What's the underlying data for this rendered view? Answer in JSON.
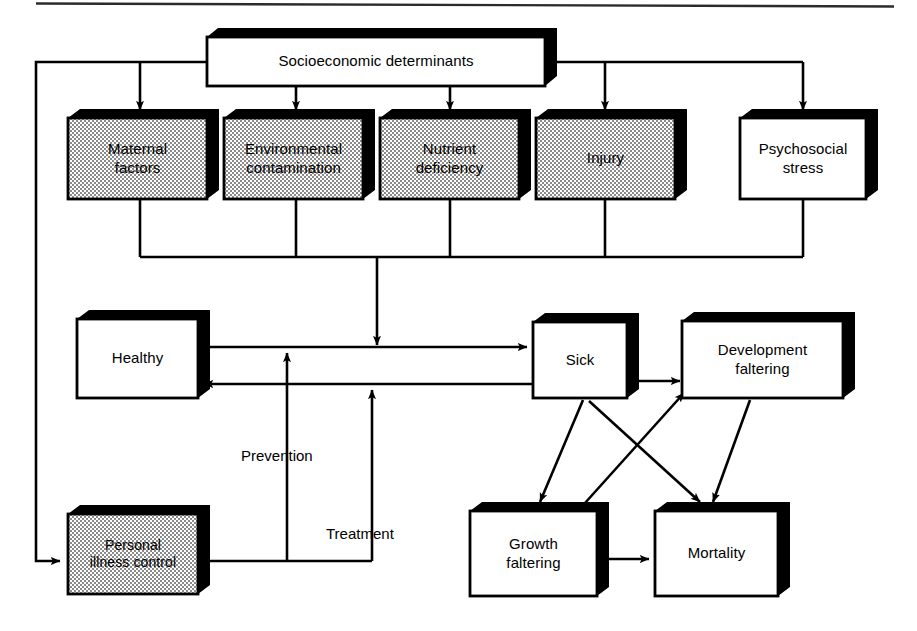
{
  "figure": {
    "type": "flow-diagram",
    "colors": {
      "line": "#000000",
      "box_fill_white": "#ffffff",
      "box_fill_shaded": "#d8d8d8",
      "shadow": "#000000",
      "background": "#ffffff"
    }
  },
  "nodes": {
    "socioeconomic_determinants": {
      "label": "Socioeconomic determinants",
      "fill": "white"
    },
    "maternal_factors": {
      "label": "Maternal\nfactors",
      "line1": "Maternal",
      "line2": "factors",
      "fill": "shaded"
    },
    "environmental_contamination": {
      "label": "Environmental\ncontamination",
      "line1": "Environmental",
      "line2": "contamination",
      "fill": "shaded"
    },
    "nutrient_deficiency": {
      "label": "Nutrient\ndeficiency",
      "line1": "Nutrient",
      "line2": "deficiency",
      "fill": "shaded"
    },
    "injury": {
      "label": "Injury",
      "line1": "Injury",
      "line2": "",
      "fill": "shaded"
    },
    "psychosocial_stress": {
      "label": "Psychosocial\nstress",
      "line1": "Psychosocial",
      "line2": "stress",
      "fill": "white"
    },
    "healthy": {
      "label": "Healthy",
      "line1": "Healthy",
      "line2": "",
      "fill": "white"
    },
    "sick": {
      "label": "Sick",
      "line1": "Sick",
      "line2": "",
      "fill": "white"
    },
    "development_faltering": {
      "label": "Development\nfaltering",
      "line1": "Development",
      "line2": "faltering",
      "fill": "white"
    },
    "personal_illness_control": {
      "label": "Personal\nillness control",
      "line1": "Personal",
      "line2": "illness control",
      "fill": "shaded"
    },
    "growth_faltering": {
      "label": "Growth\nfaltering",
      "line1": "Growth",
      "line2": "faltering",
      "fill": "white"
    },
    "mortality": {
      "label": "Mortality",
      "line1": "Mortality",
      "line2": "",
      "fill": "white"
    }
  },
  "edge_labels": {
    "prevention": "Prevention",
    "treatment": "Treatment"
  },
  "edges": [
    {
      "from": "socioeconomic_determinants",
      "to": "maternal_factors",
      "kind": "arrow"
    },
    {
      "from": "socioeconomic_determinants",
      "to": "environmental_contamination",
      "kind": "arrow"
    },
    {
      "from": "socioeconomic_determinants",
      "to": "nutrient_deficiency",
      "kind": "arrow"
    },
    {
      "from": "socioeconomic_determinants",
      "to": "injury",
      "kind": "arrow"
    },
    {
      "from": "socioeconomic_determinants",
      "to": "psychosocial_stress",
      "kind": "arrow"
    },
    {
      "from": "socioeconomic_determinants",
      "to": "personal_illness_control",
      "kind": "arrow"
    },
    {
      "from": "maternal_factors",
      "to": "sick",
      "kind": "bus-arrow"
    },
    {
      "from": "environmental_contamination",
      "to": "sick",
      "kind": "bus-arrow"
    },
    {
      "from": "nutrient_deficiency",
      "to": "sick",
      "kind": "bus-arrow"
    },
    {
      "from": "injury",
      "to": "sick",
      "kind": "bus-arrow"
    },
    {
      "from": "psychosocial_stress",
      "to": "sick",
      "kind": "bus-arrow"
    },
    {
      "from": "healthy",
      "to": "sick",
      "kind": "arrow"
    },
    {
      "from": "sick",
      "to": "healthy",
      "kind": "arrow"
    },
    {
      "from": "personal_illness_control",
      "to": "healthy_to_sick_line",
      "kind": "arrow",
      "label": "prevention"
    },
    {
      "from": "personal_illness_control",
      "to": "sick_to_healthy_line",
      "kind": "arrow",
      "label": "treatment"
    },
    {
      "from": "sick",
      "to": "development_faltering",
      "kind": "double-arrow"
    },
    {
      "from": "sick",
      "to": "growth_faltering",
      "kind": "arrow"
    },
    {
      "from": "sick",
      "to": "mortality",
      "kind": "arrow"
    },
    {
      "from": "growth_faltering",
      "to": "development_faltering",
      "kind": "arrow"
    },
    {
      "from": "development_faltering",
      "to": "mortality",
      "kind": "arrow"
    },
    {
      "from": "growth_faltering",
      "to": "mortality",
      "kind": "arrow"
    }
  ]
}
